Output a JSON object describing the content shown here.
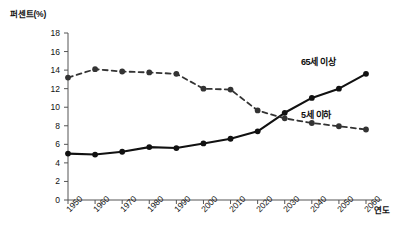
{
  "chart_data": {
    "type": "line",
    "title": "",
    "xlabel": "연도",
    "ylabel": "퍼센트(%)",
    "categories": [
      "1950",
      "1960",
      "1970",
      "1980",
      "1990",
      "2000",
      "2010",
      "2020",
      "2030",
      "2040",
      "2050",
      "2060"
    ],
    "xtick_labels": [
      "1950",
      "1960",
      "1970",
      "1980",
      "1990",
      "2000",
      "2010",
      "2020",
      "2030",
      "2040",
      "2050",
      "2060"
    ],
    "ytick_labels": [
      "0",
      "2",
      "4",
      "6",
      "8",
      "10",
      "12",
      "14",
      "16",
      "18"
    ],
    "ytick_values": [
      0,
      2,
      4,
      6,
      8,
      10,
      12,
      14,
      16,
      18
    ],
    "ylim": [
      0,
      18
    ],
    "grid": false,
    "legend_position": "inline-right",
    "series": [
      {
        "name": "65세 이상",
        "style": "solid",
        "color": "#111111",
        "marker": "circle",
        "values": [
          5.0,
          4.9,
          5.2,
          5.7,
          5.6,
          6.1,
          6.6,
          7.4,
          9.4,
          11.0,
          12.0,
          13.6
        ]
      },
      {
        "name": "5세 이하",
        "style": "dashed",
        "color": "#333333",
        "marker": "circle",
        "values": [
          13.2,
          14.1,
          13.85,
          13.75,
          13.6,
          12.0,
          11.9,
          9.65,
          8.8,
          8.3,
          7.95,
          7.6
        ]
      }
    ],
    "annotations": [
      {
        "text": "65세 이상",
        "x": 2050,
        "y": 15.0
      },
      {
        "text": "5세 이하",
        "x": 2050,
        "y": 9.3
      }
    ]
  },
  "axes": {
    "y_axis_name": "percent-axis",
    "x_axis_name": "year-axis"
  }
}
